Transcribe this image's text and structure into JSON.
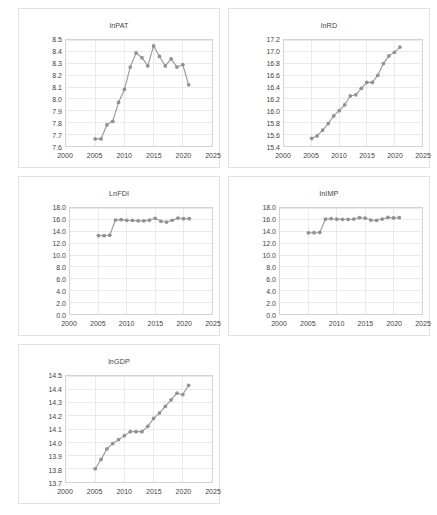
{
  "figure": {
    "panel_count": 5,
    "series_color": "#919191",
    "gridline_color": "#e8eaf0",
    "axis_color": "#d4d4d4",
    "background": "#ffffff"
  },
  "chart_data": [
    {
      "type": "line",
      "title": "lnPAT",
      "xlabel": "",
      "ylabel": "",
      "grid": true,
      "legend": "none",
      "xlim": [
        2000,
        2025
      ],
      "ylim": [
        7.6,
        8.5
      ],
      "xticks": [
        "2000",
        "2005",
        "2010",
        "2015",
        "2020",
        "2025"
      ],
      "yticks": [
        "7.6",
        "7.7",
        "7.8",
        "7.9",
        "8.0",
        "8.1",
        "8.2",
        "8.3",
        "8.4",
        "8.5"
      ],
      "x": [
        2005,
        2006,
        2007,
        2008,
        2009,
        2010,
        2011,
        2012,
        2013,
        2014,
        2015,
        2016,
        2017,
        2018,
        2019,
        2020,
        2021
      ],
      "values": [
        7.66,
        7.66,
        7.78,
        7.81,
        7.97,
        8.08,
        8.27,
        8.39,
        8.35,
        8.28,
        8.45,
        8.36,
        8.28,
        8.34,
        8.27,
        8.29,
        8.12
      ]
    },
    {
      "type": "line",
      "title": "lnRD",
      "xlabel": "",
      "ylabel": "",
      "grid": true,
      "legend": "none",
      "xlim": [
        2000,
        2025
      ],
      "ylim": [
        15.4,
        17.2
      ],
      "xticks": [
        "2000",
        "2005",
        "2010",
        "2015",
        "2020",
        "2025"
      ],
      "yticks": [
        "15.4",
        "15.6",
        "15.8",
        "16.0",
        "16.2",
        "16.4",
        "16.6",
        "16.8",
        "17.0",
        "17.2"
      ],
      "x": [
        2005,
        2006,
        2007,
        2008,
        2009,
        2010,
        2011,
        2012,
        2013,
        2014,
        2015,
        2016,
        2017,
        2018,
        2019,
        2020,
        2021
      ],
      "values": [
        15.53,
        15.57,
        15.67,
        15.78,
        15.91,
        16.0,
        16.1,
        16.25,
        16.27,
        16.38,
        16.48,
        16.48,
        16.6,
        16.8,
        16.93,
        16.99,
        17.08
      ]
    },
    {
      "type": "line",
      "title": "LnFDI",
      "xlabel": "",
      "ylabel": "",
      "grid": true,
      "legend": "none",
      "xlim": [
        2000,
        2025
      ],
      "ylim": [
        0.0,
        18.0
      ],
      "xticks": [
        "2000",
        "2005",
        "2010",
        "2015",
        "2020",
        "2025"
      ],
      "yticks": [
        "0.0",
        "2.0",
        "4.0",
        "6.0",
        "8.0",
        "10.0",
        "12.0",
        "14.0",
        "16.0",
        "18.0"
      ],
      "x": [
        2005,
        2006,
        2007,
        2008,
        2009,
        2010,
        2011,
        2012,
        2013,
        2014,
        2015,
        2016,
        2017,
        2018,
        2019,
        2020,
        2021
      ],
      "values": [
        13.32,
        13.3,
        13.38,
        15.95,
        16.02,
        15.9,
        15.88,
        15.82,
        15.82,
        15.95,
        16.25,
        15.75,
        15.62,
        15.92,
        16.3,
        16.18,
        16.18
      ]
    },
    {
      "type": "line",
      "title": "lnIMP",
      "xlabel": "",
      "ylabel": "",
      "grid": true,
      "legend": "none",
      "xlim": [
        2000,
        2025
      ],
      "ylim": [
        0.0,
        18.0
      ],
      "xticks": [
        "2000",
        "2005",
        "2010",
        "2015",
        "2020",
        "2025"
      ],
      "yticks": [
        "0.0",
        "2.0",
        "4.0",
        "6.0",
        "8.0",
        "10.0",
        "12.0",
        "14.0",
        "16.0",
        "18.0"
      ],
      "x": [
        2005,
        2006,
        2007,
        2008,
        2009,
        2010,
        2011,
        2012,
        2013,
        2014,
        2015,
        2016,
        2017,
        2018,
        2019,
        2020,
        2021
      ],
      "values": [
        13.78,
        13.8,
        13.85,
        16.12,
        16.18,
        16.1,
        16.08,
        16.08,
        16.12,
        16.35,
        16.3,
        15.95,
        15.92,
        16.12,
        16.4,
        16.32,
        16.35
      ]
    },
    {
      "type": "line",
      "title": "lnGDP",
      "xlabel": "",
      "ylabel": "",
      "grid": true,
      "legend": "none",
      "xlim": [
        2000,
        2025
      ],
      "ylim": [
        13.7,
        14.5
      ],
      "xticks": [
        "2000",
        "2005",
        "2010",
        "2015",
        "2020",
        "2025"
      ],
      "yticks": [
        "13.7",
        "13.8",
        "13.9",
        "14.0",
        "14.1",
        "14.2",
        "14.3",
        "14.4",
        "14.5"
      ],
      "x": [
        2005,
        2006,
        2007,
        2008,
        2009,
        2010,
        2011,
        2012,
        2013,
        2014,
        2015,
        2016,
        2017,
        2018,
        2019,
        2020,
        2021
      ],
      "values": [
        13.8,
        13.87,
        13.95,
        13.99,
        14.02,
        14.05,
        14.08,
        14.08,
        14.08,
        14.12,
        14.18,
        14.22,
        14.27,
        14.32,
        14.37,
        14.36,
        14.43
      ]
    }
  ]
}
